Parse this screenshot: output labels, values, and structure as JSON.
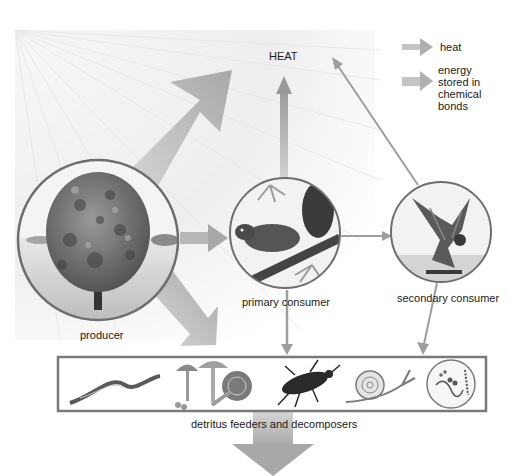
{
  "diagram": {
    "type": "energy-flow-food-chain",
    "heat_label": "HEAT",
    "legend": {
      "items": [
        {
          "label": "heat",
          "icon": "thin-arrow-icon",
          "color": "#b8b8b8"
        },
        {
          "label_lines": [
            "energy",
            "stored in",
            "chemical",
            "bonds"
          ],
          "icon": "wide-arrow-icon",
          "color": "#b8b8b8"
        }
      ]
    },
    "nodes": [
      {
        "id": "producer",
        "label": "producer",
        "image": "tree"
      },
      {
        "id": "primary",
        "label": "primary consumer",
        "image": "squirrel"
      },
      {
        "id": "secondary",
        "label": "secondary consumer",
        "image": "hawk"
      }
    ],
    "decomposers": {
      "label": "detritus feeders and decomposers",
      "images": [
        "earthworm",
        "mushrooms",
        "beetle",
        "snail",
        "bacteria"
      ]
    },
    "colors": {
      "arrow": "#b4b4b4",
      "arrow_dark": "#9a9a9a",
      "circle_border": "#6e6e6e",
      "box_border": "#7a7a7a",
      "sun_glow": "#efefef"
    }
  }
}
